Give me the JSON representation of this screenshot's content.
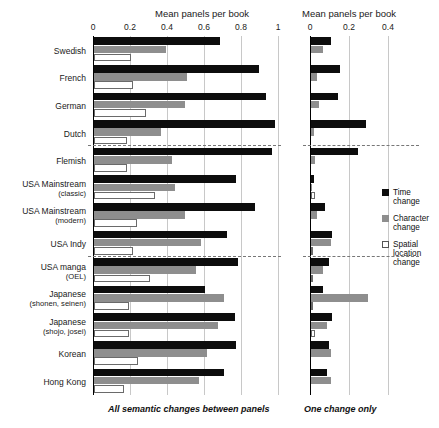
{
  "chart_data": {
    "type": "bar",
    "orientation": "horizontal",
    "title": "",
    "panels": [
      {
        "name": "left",
        "caption": "All semantic changes between panels",
        "xlabel": "Mean panels per book",
        "ylabel": "",
        "xlim": [
          0,
          1
        ],
        "xticks": [
          0,
          0.2,
          0.4,
          0.6,
          0.8,
          1
        ],
        "xtick_labels": [
          "0",
          "0.2",
          "0.4",
          "0.6",
          "0.8",
          "1"
        ],
        "grid": true,
        "series": [
          {
            "name": "Time change",
            "color": "#0d0d0d",
            "values": [
              0.68,
              0.89,
              0.93,
              0.98,
              0.96,
              0.77,
              0.87,
              0.72,
              0.78,
              0.6,
              0.76,
              0.77,
              0.7
            ]
          },
          {
            "name": "Character change",
            "color": "#8e8e8e",
            "values": [
              0.39,
              0.5,
              0.49,
              0.36,
              0.42,
              0.44,
              0.49,
              0.58,
              0.55,
              0.7,
              0.67,
              0.61,
              0.57
            ]
          },
          {
            "name": "Spatial location change",
            "color": "#ffffff",
            "values": [
              0.2,
              0.21,
              0.28,
              0.18,
              0.18,
              0.33,
              0.23,
              0.21,
              0.3,
              0.19,
              0.19,
              0.24,
              0.16
            ]
          }
        ]
      },
      {
        "name": "right",
        "caption": "One change only",
        "xlabel": "Mean panels per book",
        "ylabel": "",
        "xlim": [
          0,
          0.5
        ],
        "xticks": [
          0,
          0.2,
          0.4
        ],
        "xtick_labels": [
          "0",
          "0.2",
          "0.4"
        ],
        "grid": true,
        "series": [
          {
            "name": "Time change",
            "color": "#0d0d0d",
            "values": [
              0.1,
              0.15,
              0.14,
              0.28,
              0.24,
              0.015,
              0.07,
              0.11,
              0.09,
              0.06,
              0.11,
              0.09,
              0.08
            ]
          },
          {
            "name": "Character change",
            "color": "#8e8e8e",
            "values": [
              0.06,
              0.03,
              0.04,
              0.015,
              0.02,
              0.005,
              0.03,
              0.1,
              0.06,
              0.29,
              0.08,
              0.1,
              0.1
            ]
          },
          {
            "name": "Spatial location change",
            "color": "#ffffff",
            "values": [
              0.0,
              0.0,
              0.0,
              0.0,
              0.0,
              0.02,
              0.0,
              0.005,
              0.01,
              0.005,
              0.02,
              0.0,
              0.0
            ]
          }
        ]
      }
    ],
    "categories": [
      {
        "label": "Swedish",
        "sub": ""
      },
      {
        "label": "French",
        "sub": ""
      },
      {
        "label": "German",
        "sub": ""
      },
      {
        "label": "Dutch",
        "sub": ""
      },
      {
        "label": "Flemish",
        "sub": ""
      },
      {
        "label": "USA Mainstream",
        "sub": "(classic)"
      },
      {
        "label": "USA Mainstream",
        "sub": "(modern)"
      },
      {
        "label": "USA Indy",
        "sub": ""
      },
      {
        "label": "USA manga",
        "sub": "(OEL)"
      },
      {
        "label": "Japanese",
        "sub": "(shonen, seinen)"
      },
      {
        "label": "Japanese",
        "sub": "(shojo, josei)"
      },
      {
        "label": "Korean",
        "sub": ""
      },
      {
        "label": "Hong Kong",
        "sub": ""
      }
    ],
    "group_separators_after": [
      4,
      8
    ],
    "legend": {
      "position": "right",
      "entries": [
        {
          "label": "Time change",
          "color": "#0d0d0d",
          "swatch": "time"
        },
        {
          "label": "Character change",
          "color": "#8e8e8e",
          "swatch": "character"
        },
        {
          "label": "Spatial location change",
          "color": "#ffffff",
          "swatch": "spatial"
        }
      ]
    }
  }
}
